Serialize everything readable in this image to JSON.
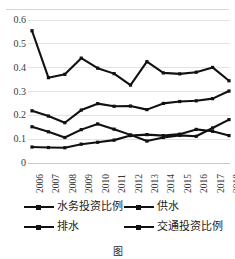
{
  "chart_data": {
    "type": "line",
    "title": "",
    "xlabel": "",
    "ylabel": "",
    "grid": true,
    "legend_position": "bottom",
    "ylim": [
      0,
      0.6
    ],
    "yticks": [
      "0",
      "0.1",
      "0.2",
      "0.3",
      "0.4",
      "0.5",
      "0.6"
    ],
    "ytick_values": [
      0,
      0.1,
      0.2,
      0.3,
      0.4,
      0.5,
      0.6
    ],
    "categories": [
      "2006",
      "2007",
      "2008",
      "2009",
      "2010",
      "2011",
      "2012",
      "2013",
      "2014",
      "2015",
      "2016",
      "2017",
      "2018"
    ],
    "series": [
      {
        "name": "水务投资比例",
        "marker": "square",
        "color": "#111111",
        "values": [
          0.555,
          0.358,
          0.372,
          0.44,
          0.398,
          0.375,
          0.327,
          0.425,
          0.378,
          0.374,
          0.381,
          0.401,
          0.345
        ]
      },
      {
        "name": "供水",
        "marker": "square",
        "color": "#111111",
        "values": [
          0.219,
          0.197,
          0.169,
          0.222,
          0.249,
          0.238,
          0.239,
          0.224,
          0.25,
          0.258,
          0.261,
          0.27,
          0.302
        ]
      },
      {
        "name": "排水",
        "marker": "square",
        "color": "#111111",
        "values": [
          0.152,
          0.131,
          0.107,
          0.14,
          0.164,
          0.142,
          0.118,
          0.092,
          0.107,
          0.116,
          0.112,
          0.147,
          0.182
        ]
      },
      {
        "name": "交通投资比例",
        "marker": "square",
        "color": "#111111",
        "values": [
          0.067,
          0.065,
          0.064,
          0.079,
          0.087,
          0.096,
          0.115,
          0.119,
          0.115,
          0.121,
          0.141,
          0.133,
          0.115
        ]
      }
    ]
  },
  "legend": {
    "items": [
      {
        "label": "水务投资比例"
      },
      {
        "label": "供水"
      },
      {
        "label": "排水"
      },
      {
        "label": "交通投资比例"
      }
    ]
  },
  "caption": {
    "text": "图"
  }
}
